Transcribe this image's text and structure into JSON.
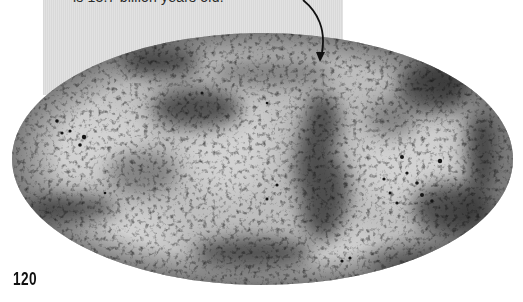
{
  "page": {
    "caption": "is 13.7 billion years old.",
    "page_number": "120"
  },
  "figure": {
    "type": "all-sky-map",
    "projection": "mollweide-ellipse",
    "style": "grayscale-mottled",
    "colors": {
      "base": "#b9b9b9",
      "light_patch": "#cfcfcf",
      "dark_patch": "#2e2e2e",
      "caption_box": "#dedede",
      "arrow": "#111111"
    }
  },
  "icons": {
    "annotation_arrow": "curved-arrow-icon"
  }
}
